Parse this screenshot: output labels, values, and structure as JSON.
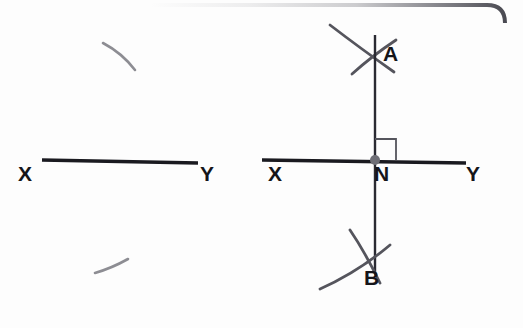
{
  "figure": {
    "background_color": "#fdfdfd",
    "ink_color": "#1a1a20",
    "faint_ink_color": "#8d8d93",
    "frame_color": "#5a5a62",
    "point_marker_color": "#6e6e76"
  },
  "panels": [
    {
      "id": "left-panel",
      "name": "step-1-initial-line",
      "description": "Line segment XY drawn with two faint construction arcs",
      "labels": [
        {
          "id": "left-x",
          "text": "X",
          "x": 18,
          "y": 163
        },
        {
          "id": "left-y",
          "text": "Y",
          "x": 200,
          "y": 163
        }
      ]
    },
    {
      "id": "right-panel",
      "name": "step-2-perpendicular-constructed",
      "description": "Line XY with point N, perpendicular line through N, arcs intersecting at A above and B below, right angle marker at N",
      "labels": [
        {
          "id": "right-a",
          "text": "A",
          "x": 383,
          "y": 43
        },
        {
          "id": "right-x",
          "text": "X",
          "x": 268,
          "y": 163
        },
        {
          "id": "right-n",
          "text": "N",
          "x": 374,
          "y": 163
        },
        {
          "id": "right-y",
          "text": "Y",
          "x": 466,
          "y": 163
        },
        {
          "id": "right-b",
          "text": "B",
          "x": 364,
          "y": 267
        }
      ]
    }
  ],
  "geometry": {
    "left_line": {
      "x1": 42,
      "y1": 160,
      "x2": 198,
      "y2": 163
    },
    "left_arc_upper": {
      "d": "M 103 43 Q 122 53 135 70"
    },
    "left_arc_lower": {
      "d": "M 95 273 Q 112 268 128 259"
    },
    "right_line": {
      "x1": 262,
      "y1": 160,
      "x2": 466,
      "y2": 163
    },
    "right_vertical": {
      "x1": 375,
      "y1": 35,
      "x2": 375,
      "y2": 272
    },
    "right_arc_a1": {
      "d": "M 330 25 Q 360 48 394 72"
    },
    "right_arc_a2": {
      "d": "M 352 74 Q 372 56 396 40"
    },
    "right_arc_b1": {
      "d": "M 350 230 Q 365 252 380 283"
    },
    "right_arc_b2": {
      "d": "M 320 289 Q 358 272 390 245"
    },
    "point_n": {
      "cx": 375,
      "cy": 160,
      "r": 5
    },
    "right_angle_marker": {
      "x": 375,
      "y": 139,
      "size": 21
    }
  },
  "frame": {
    "visible_edges": "top and right, rounded top-right corner",
    "corner_radius": 18
  }
}
